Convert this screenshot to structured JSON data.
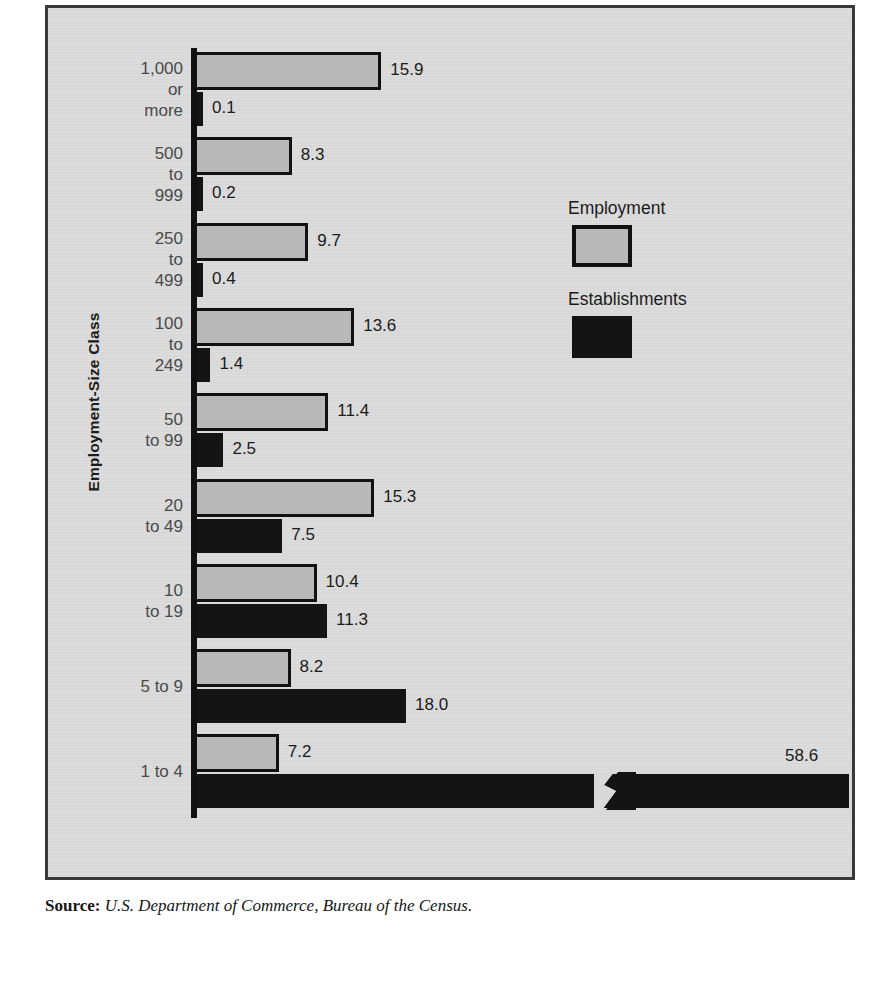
{
  "figure": {
    "axis_title": "Employment-Size Class",
    "source_label": "Source:",
    "source_text": "U.S. Department of Commerce, Bureau of the Census."
  },
  "legend": {
    "employment_label": "Employment",
    "establishments_label": "Establishments",
    "employment_color": "#b9b9b9",
    "establishments_color": "#141414"
  },
  "chart_data": {
    "type": "bar",
    "orientation": "horizontal",
    "title": "",
    "xlabel": "",
    "ylabel": "Employment-Size Class",
    "categories": [
      "1,000\nor\nmore",
      "500\nto\n999",
      "250\nto\n499",
      "100\nto\n249",
      "50\nto 99",
      "20\nto 49",
      "10\nto 19",
      "5 to 9",
      "1 to 4"
    ],
    "series": [
      {
        "name": "Employment",
        "color": "#b9b9b9",
        "values": [
          15.9,
          8.3,
          9.7,
          13.6,
          11.4,
          15.3,
          10.4,
          8.2,
          7.2
        ],
        "labels": [
          "15.9",
          "8.3",
          "9.7",
          "13.6",
          "11.4",
          "15.3",
          "10.4",
          "8.2",
          "7.2"
        ]
      },
      {
        "name": "Establishments",
        "color": "#141414",
        "values": [
          0.1,
          0.2,
          0.4,
          1.4,
          2.5,
          7.5,
          11.3,
          18.0,
          58.6
        ],
        "labels": [
          "0.1",
          "0.2",
          "0.4",
          "1.4",
          "2.5",
          "7.5",
          "11.3",
          "18.0",
          "58.6"
        ]
      }
    ],
    "units": "percent",
    "xlim": [
      0,
      58.6
    ],
    "grid": false,
    "legend_position": "middle-right",
    "axis_break": {
      "series": "Establishments",
      "category": "1 to 4",
      "note": "bar is truncated with a zigzag break mark"
    }
  }
}
